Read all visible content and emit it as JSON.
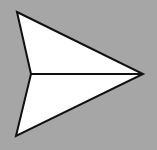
{
  "icon": {
    "name": "send-icon",
    "semantic": "paper-plane / send",
    "colors": {
      "background": "#a6a6a6",
      "fill": "#ffffff",
      "stroke": "#111111"
    },
    "shape": {
      "tip": [
        143,
        74
      ],
      "top_wing": [
        17,
        12
      ],
      "bottom_wing": [
        16,
        136
      ],
      "notch": [
        31,
        74
      ]
    }
  }
}
